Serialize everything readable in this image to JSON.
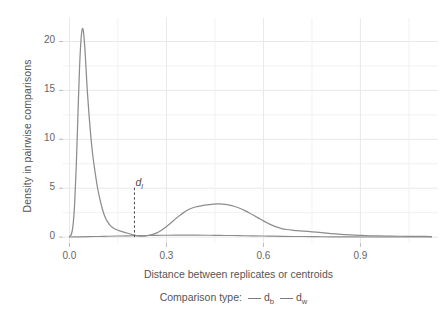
{
  "chart_data": {
    "type": "line",
    "title": "",
    "subtitle": "",
    "xlabel": "Distance between replicates or centroids",
    "ylabel": "Density in pairwise comparisons",
    "xlim": [
      -0.02,
      1.14
    ],
    "ylim": [
      -0.6,
      22.4
    ],
    "xticks": [
      0.0,
      0.3,
      0.6,
      0.9
    ],
    "xticklabels": [
      "0.0",
      "0.3",
      "0.6",
      "0.9"
    ],
    "yticks": [
      0,
      5,
      10,
      15,
      20
    ],
    "yticklabels": [
      "0",
      "5",
      "10",
      "15",
      "20"
    ],
    "y_minor_ticks": [
      2.5,
      7.5,
      12.5,
      17.5
    ],
    "grid": true,
    "grid_color": "#e8e8e8",
    "minor_grid_color": "#f1f1f1",
    "legend": {
      "title": "Comparison type:",
      "position": "bottom",
      "entries": [
        {
          "key": "d",
          "sub": "b",
          "color": "#7d7d7d"
        },
        {
          "key": "d",
          "sub": "w",
          "color": "#7d7d7d"
        }
      ]
    },
    "annotations": [
      {
        "name": "threshold-line",
        "key": "d",
        "sub": "l",
        "x": 0.201,
        "label_y": 5.6,
        "style": "dashed",
        "color": "#4a4a4a"
      }
    ],
    "series": [
      {
        "name": "d_b",
        "color": "#8d8d8d",
        "width": 1.25,
        "points": [
          [
            0.0,
            0.05
          ],
          [
            0.006,
            0.3
          ],
          [
            0.011,
            1.2
          ],
          [
            0.016,
            3.4
          ],
          [
            0.021,
            7.2
          ],
          [
            0.026,
            12.3
          ],
          [
            0.031,
            17.2
          ],
          [
            0.036,
            20.3
          ],
          [
            0.04,
            21.3
          ],
          [
            0.044,
            20.8
          ],
          [
            0.049,
            18.6
          ],
          [
            0.054,
            15.6
          ],
          [
            0.06,
            12.7
          ],
          [
            0.066,
            10.3
          ],
          [
            0.072,
            8.4
          ],
          [
            0.079,
            6.7
          ],
          [
            0.086,
            5.2
          ],
          [
            0.094,
            3.9
          ],
          [
            0.102,
            2.85
          ],
          [
            0.11,
            2.05
          ],
          [
            0.119,
            1.5
          ],
          [
            0.128,
            1.12
          ],
          [
            0.138,
            0.88
          ],
          [
            0.148,
            0.73
          ],
          [
            0.158,
            0.62
          ],
          [
            0.168,
            0.52
          ],
          [
            0.178,
            0.42
          ],
          [
            0.188,
            0.32
          ],
          [
            0.198,
            0.22
          ],
          [
            0.21,
            0.14
          ],
          [
            0.222,
            0.1
          ],
          [
            0.234,
            0.11
          ],
          [
            0.246,
            0.17
          ],
          [
            0.258,
            0.28
          ],
          [
            0.27,
            0.44
          ],
          [
            0.282,
            0.66
          ],
          [
            0.294,
            0.93
          ],
          [
            0.306,
            1.24
          ],
          [
            0.318,
            1.58
          ],
          [
            0.33,
            1.92
          ],
          [
            0.342,
            2.24
          ],
          [
            0.354,
            2.53
          ],
          [
            0.366,
            2.77
          ],
          [
            0.378,
            2.95
          ],
          [
            0.39,
            3.08
          ],
          [
            0.404,
            3.18
          ],
          [
            0.418,
            3.26
          ],
          [
            0.432,
            3.33
          ],
          [
            0.446,
            3.38
          ],
          [
            0.46,
            3.4
          ],
          [
            0.474,
            3.38
          ],
          [
            0.488,
            3.32
          ],
          [
            0.502,
            3.22
          ],
          [
            0.516,
            3.08
          ],
          [
            0.53,
            2.9
          ],
          [
            0.544,
            2.68
          ],
          [
            0.558,
            2.44
          ],
          [
            0.572,
            2.18
          ],
          [
            0.586,
            1.92
          ],
          [
            0.6,
            1.66
          ],
          [
            0.614,
            1.42
          ],
          [
            0.628,
            1.2
          ],
          [
            0.642,
            1.02
          ],
          [
            0.656,
            0.88
          ],
          [
            0.672,
            0.78
          ],
          [
            0.688,
            0.71
          ],
          [
            0.706,
            0.66
          ],
          [
            0.724,
            0.61
          ],
          [
            0.744,
            0.56
          ],
          [
            0.764,
            0.5
          ],
          [
            0.786,
            0.44
          ],
          [
            0.808,
            0.37
          ],
          [
            0.832,
            0.31
          ],
          [
            0.856,
            0.25
          ],
          [
            0.88,
            0.21
          ],
          [
            0.906,
            0.17
          ],
          [
            0.932,
            0.14
          ],
          [
            0.96,
            0.12
          ],
          [
            0.99,
            0.1
          ],
          [
            1.02,
            0.09
          ],
          [
            1.055,
            0.08
          ],
          [
            1.09,
            0.07
          ],
          [
            1.12,
            0.06
          ]
        ]
      },
      {
        "name": "d_w",
        "color": "#8d8d8d",
        "width": 1.1,
        "points": [
          [
            0.0,
            0.02
          ],
          [
            0.03,
            0.03
          ],
          [
            0.06,
            0.05
          ],
          [
            0.09,
            0.07
          ],
          [
            0.12,
            0.09
          ],
          [
            0.15,
            0.11
          ],
          [
            0.18,
            0.13
          ],
          [
            0.21,
            0.15
          ],
          [
            0.24,
            0.17
          ],
          [
            0.27,
            0.18
          ],
          [
            0.3,
            0.19
          ],
          [
            0.33,
            0.2
          ],
          [
            0.36,
            0.2
          ],
          [
            0.39,
            0.2
          ],
          [
            0.42,
            0.19
          ],
          [
            0.45,
            0.18
          ],
          [
            0.48,
            0.17
          ],
          [
            0.51,
            0.16
          ],
          [
            0.54,
            0.14
          ],
          [
            0.57,
            0.13
          ],
          [
            0.6,
            0.11
          ],
          [
            0.63,
            0.1
          ],
          [
            0.66,
            0.08
          ],
          [
            0.69,
            0.07
          ],
          [
            0.72,
            0.06
          ],
          [
            0.75,
            0.05
          ],
          [
            0.78,
            0.04
          ],
          [
            0.82,
            0.03
          ],
          [
            0.87,
            0.03
          ],
          [
            0.93,
            0.02
          ],
          [
            1.0,
            0.02
          ],
          [
            1.06,
            0.01
          ],
          [
            1.12,
            0.01
          ]
        ]
      }
    ]
  }
}
